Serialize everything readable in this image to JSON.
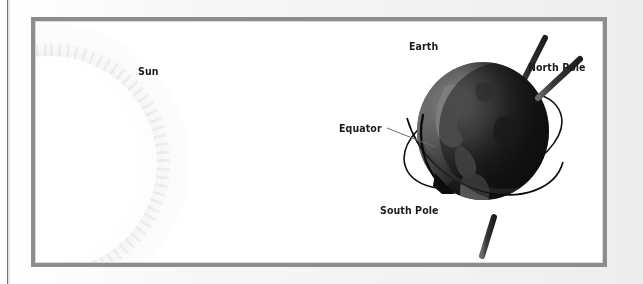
{
  "figure": {
    "kind": "astronomy-illustration",
    "background_color": "#ffffff",
    "frame_color": "#8d8d90",
    "page_color": "#f2f2f2"
  },
  "labels": {
    "sun": "Sun",
    "earth": "Earth",
    "north_pole": "North Pole",
    "equator": "Equator",
    "south_pole": "South Pole"
  },
  "elements": {
    "sun_icon": "sun-glow-icon",
    "globe_icon": "earth-globe-icon",
    "axis_icon": "rotation-axis-icon",
    "equator_ring_icon": "equator-ring-icon",
    "rotation_arrow_icon": "rotation-arrow-icon",
    "equator_leader_icon": "equator-leader-line-icon"
  },
  "colors": {
    "globe_dark": "#151515",
    "globe_lit": "#6f6f6f",
    "axis": "#2b2b2b",
    "ring": "#101010",
    "label_text": "#1a1a1a"
  }
}
